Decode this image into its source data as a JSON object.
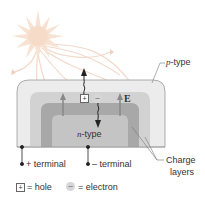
{
  "figure": {
    "labels": {
      "p_type_prefix": "p",
      "p_type_suffix": "-type",
      "n_type_prefix": "n",
      "n_type_suffix": "-type",
      "field": "E",
      "plus_terminal": "+ terminal",
      "minus_terminal": "– terminal",
      "charge_layers_line1": "Charge",
      "charge_layers_line2": "layers",
      "hole_symbol": "+",
      "electron_symbol": "–"
    },
    "legend": {
      "hole_symbol": "+",
      "hole_text": "= hole",
      "electron_symbol": "–",
      "electron_text": "= electron"
    },
    "colors": {
      "p_type_outer": "#ececec",
      "charge_layer_light": "#d2d2d2",
      "charge_layer_dark": "#a8a8a8",
      "n_type_inner": "#c4c4c4",
      "sun": "#f6dcc8",
      "rays": "#f3d9cc",
      "arrow": "#222222",
      "field_arrow": "#888888"
    },
    "icons": {
      "sun": "sun-icon",
      "rays": "light-ray-icons"
    }
  }
}
